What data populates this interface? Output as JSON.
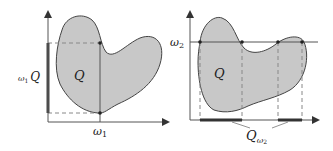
{
  "colors": {
    "fill": "#c8c8c8",
    "stroke": "#444444",
    "axis": "#555555",
    "bar": "#333333",
    "dash": "#888888"
  },
  "left_panel": {
    "blob_label": "Q",
    "x_tick_label": "ω",
    "x_tick_sub": "1",
    "y_bar_label_prefix": "ω",
    "y_bar_label_sub": "1",
    "y_bar_label_suffix": "Q"
  },
  "right_panel": {
    "blob_label": "Q",
    "y_tick_label": "ω",
    "y_tick_sub": "2",
    "x_bar_label": "Q",
    "x_bar_label_sub": "ω",
    "x_bar_label_subsub": "2"
  }
}
